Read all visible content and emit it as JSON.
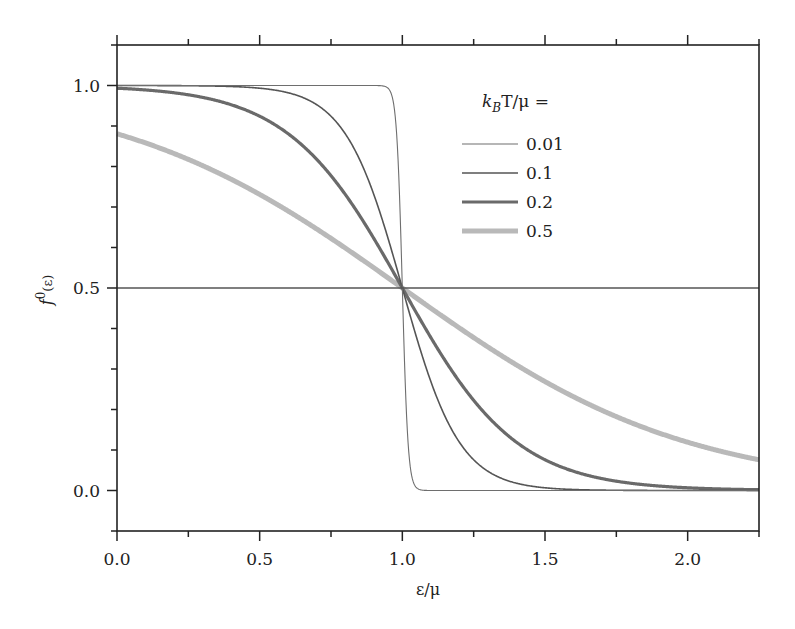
{
  "chart_data": {
    "type": "line",
    "title": "",
    "xlabel": "ε/μ",
    "ylabel": "f⁰(ε)",
    "ylabel_base": "f",
    "ylabel_sup": "0",
    "ylabel_arg": "(ε)",
    "xlim": [
      0.0,
      2.25
    ],
    "ylim": [
      -0.1,
      1.1
    ],
    "x_major_ticks": [
      0.0,
      0.5,
      1.0,
      1.5,
      2.0
    ],
    "x_tick_labels": [
      "0.0",
      "0.5",
      "1.0",
      "1.5",
      "2.0"
    ],
    "x_minor_step": 0.25,
    "y_major_ticks": [
      0.0,
      0.5,
      1.0
    ],
    "y_tick_labels": [
      "0.0",
      "0.5",
      "1.0"
    ],
    "y_minor_step": 0.1,
    "grid": false,
    "reference_line": {
      "y": 0.5,
      "color": "#555555"
    },
    "function": "f(x) = 1 / (exp((x - 1) / t) + 1)",
    "legend": {
      "title_k": "k",
      "title_sub": "B",
      "title_rest": "T/μ =",
      "placement": "upper-right"
    },
    "series": [
      {
        "name": "0.01",
        "t": 0.01,
        "color": "#6e6e6e",
        "weight": "thin"
      },
      {
        "name": "0.1",
        "t": 0.1,
        "color": "#555555",
        "weight": "medium"
      },
      {
        "name": "0.2",
        "t": 0.2,
        "color": "#6a6a6a",
        "weight": "thick"
      },
      {
        "name": "0.5",
        "t": 0.5,
        "color": "#b9b9b9",
        "weight": "thickest"
      }
    ]
  }
}
